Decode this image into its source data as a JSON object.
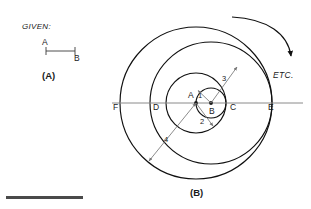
{
  "figure": {
    "given_label": "GIVEN:",
    "panel_a_caption": "(A)",
    "panel_b_caption": "(B)",
    "etc_label": "ETC.",
    "given_segment": {
      "start_label": "A",
      "end_label": "B"
    },
    "points": [
      {
        "id": "F",
        "label": "F",
        "x": 127,
        "y": 103
      },
      {
        "id": "D",
        "label": "D",
        "x": 166,
        "y": 103
      },
      {
        "id": "A",
        "label": "A",
        "x": 196,
        "y": 103
      },
      {
        "id": "B",
        "label": "B",
        "x": 211,
        "y": 103
      },
      {
        "id": "C",
        "label": "C",
        "x": 226,
        "y": 103
      },
      {
        "id": "E",
        "label": "E",
        "x": 272,
        "y": 103
      }
    ],
    "circles": [
      {
        "name": "circle-1-small",
        "center": "B",
        "cx": 211,
        "cy": 103,
        "r": 15
      },
      {
        "name": "circle-2-middle",
        "center": "A",
        "cx": 196,
        "cy": 103,
        "r": 30
      },
      {
        "name": "circle-3-outer",
        "center": "B",
        "cx": 211,
        "cy": 103,
        "r": 61
      },
      {
        "name": "circle-4-outermost",
        "center": "A",
        "cx": 196,
        "cy": 103,
        "r": 76
      }
    ],
    "radius_arrows": [
      {
        "label": "1",
        "from": "B",
        "x1": 211,
        "y1": 103,
        "x2": 197,
        "y2": 90,
        "lx": 200,
        "ly": 95
      },
      {
        "label": "2",
        "from": "A",
        "x1": 196,
        "y1": 103,
        "x2": 214,
        "y2": 127,
        "lx": 201,
        "ly": 121
      },
      {
        "label": "3",
        "from": "B",
        "x1": 211,
        "y1": 103,
        "x2": 238,
        "y2": 66,
        "lx": 222,
        "ly": 79
      },
      {
        "label": "4",
        "from": "A",
        "x1": 196,
        "y1": 103,
        "x2": 148,
        "y2": 162,
        "lx": 165,
        "ly": 139
      }
    ],
    "baseline": {
      "y": 103,
      "x_start": 112,
      "x_end": 303
    },
    "colors": {
      "ink": "#101010",
      "baseline": "#8a8a8a",
      "arrow": "#777777",
      "rule_bar": "#4a4a4a",
      "background": "#ffffff"
    }
  }
}
